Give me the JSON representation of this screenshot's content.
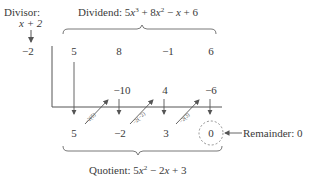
{
  "divisor": {
    "label": "Divisor:",
    "expression": "x + 2",
    "root": "−2"
  },
  "dividend": {
    "label": "Dividend:",
    "expression": "5x³ + 8x² − x + 6",
    "coefficients": [
      "5",
      "8",
      "−1",
      "6"
    ]
  },
  "products_row": [
    "−10",
    "4",
    "−6"
  ],
  "multiplier_labels": [
    "−2(5)",
    "−2(−2)",
    "−2(3)"
  ],
  "result_row": [
    "5",
    "−2",
    "3",
    "0"
  ],
  "remainder": {
    "label": "Remainder: 0",
    "value": "0"
  },
  "quotient": {
    "label": "Quotient:",
    "expression": "5x² − 2x + 3"
  },
  "colors": {
    "text": "#3a3a3a",
    "lines": "#555555",
    "dashed_circle": "#777777"
  }
}
